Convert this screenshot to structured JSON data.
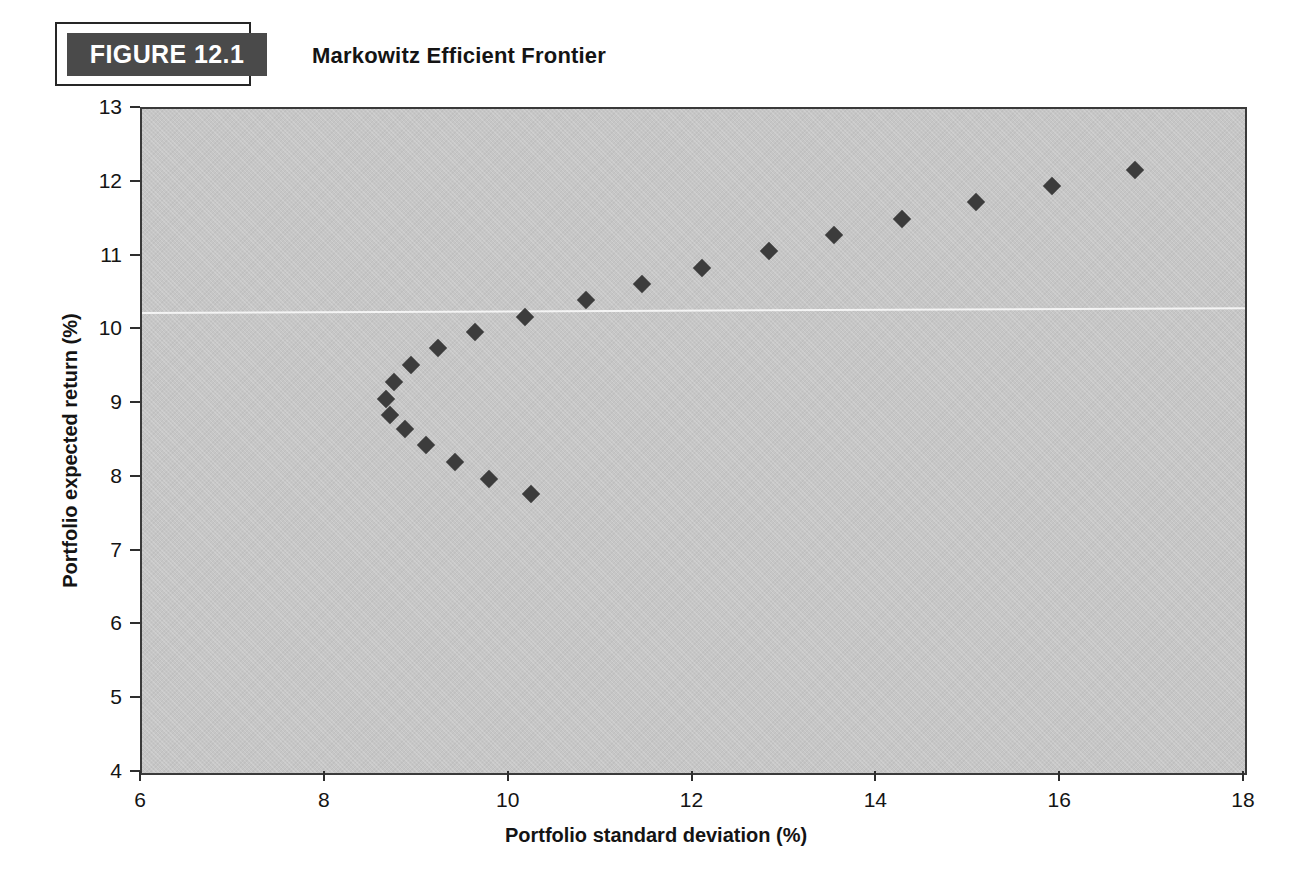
{
  "figure": {
    "badge_label": "FIGURE 12.1",
    "title": "Markowitz Efficient Frontier"
  },
  "colors": {
    "plot_background": "#c6c6c6",
    "marker": "#3c3c3c",
    "badge_fill": "#4a4a4a",
    "badge_text": "#ffffff",
    "axis": "#2e2e2e",
    "text": "#141414",
    "page_background": "#ffffff"
  },
  "chart_data": {
    "type": "scatter",
    "title": "Markowitz Efficient Frontier",
    "xlabel": "Portfolio standard deviation (%)",
    "ylabel": "Portfolio expected return (%)",
    "xlim": [
      6,
      18
    ],
    "ylim": [
      4,
      13
    ],
    "xticks": [
      6,
      8,
      10,
      12,
      14,
      16,
      18
    ],
    "yticks": [
      4,
      5,
      6,
      7,
      8,
      9,
      10,
      11,
      12,
      13
    ],
    "xtick_labels": [
      "6",
      "8",
      "10",
      "12",
      "14",
      "16",
      "18"
    ],
    "ytick_labels": [
      "4",
      "5",
      "6",
      "7",
      "8",
      "9",
      "10",
      "11",
      "12",
      "13"
    ],
    "grid": false,
    "legend": false,
    "marker_shape": "diamond",
    "series": [
      {
        "name": "Minimum-variance frontier",
        "points": [
          [
            10.23,
            7.78
          ],
          [
            9.78,
            7.99
          ],
          [
            9.4,
            8.22
          ],
          [
            9.09,
            8.44
          ],
          [
            8.86,
            8.66
          ],
          [
            8.7,
            8.85
          ],
          [
            8.65,
            9.07
          ],
          [
            8.74,
            9.3
          ],
          [
            8.93,
            9.53
          ],
          [
            9.22,
            9.76
          ],
          [
            9.62,
            9.98
          ],
          [
            10.17,
            10.18
          ],
          [
            10.83,
            10.41
          ],
          [
            11.44,
            10.63
          ],
          [
            12.09,
            10.85
          ],
          [
            12.82,
            11.07
          ],
          [
            13.53,
            11.29
          ],
          [
            14.27,
            11.51
          ],
          [
            15.07,
            11.74
          ],
          [
            15.9,
            11.96
          ],
          [
            16.8,
            12.17
          ]
        ]
      }
    ]
  }
}
